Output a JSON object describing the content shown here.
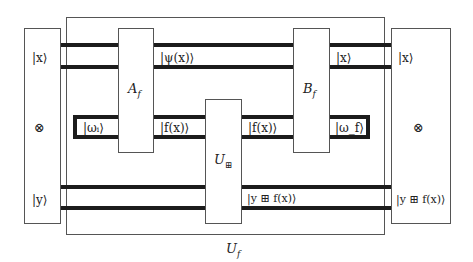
{
  "diagram": {
    "outer_gate": {
      "label": "U_f",
      "display": "U",
      "sub": "f"
    },
    "left_register": {
      "top_state": "|x⟩",
      "tensor_symbol": "⊗",
      "bottom_state": "|y⟩"
    },
    "right_register": {
      "top_state": "|x⟩",
      "tensor_symbol": "⊗",
      "bottom_state": "|y ⊞ f(x)⟩"
    },
    "gates": [
      {
        "id": "A_f",
        "display": "A",
        "sub": "f"
      },
      {
        "id": "U_boxplus",
        "display": "U",
        "sub": "⊞"
      },
      {
        "id": "B_f",
        "display": "B",
        "sub": "f"
      }
    ],
    "wire_labels": {
      "psi": "|ψ(x)⟩",
      "x_after_B": "|x⟩",
      "omega_initial": "|ω_i⟩",
      "omega_initial_display": "|ωᵢ⟩",
      "f_after_A": "|f(x)⟩",
      "f_after_U": "|f(x)⟩",
      "omega_final": "|ω_f⟩",
      "omega_final_display": "|ω_f⟩",
      "y_plus_f": "|y ⊞ f(x)⟩"
    },
    "colors": {
      "wire": "#1c1c1c",
      "box_border": "#555555",
      "background": "#ffffff"
    }
  }
}
